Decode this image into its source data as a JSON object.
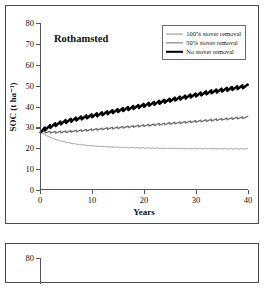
{
  "figure": {
    "panels": [
      {
        "name": "Rothamsted panel"
      },
      {
        "name": "second panel (cropped)"
      }
    ]
  },
  "panel1": {
    "title": "Rothamsted",
    "xlabel": "Years",
    "ylabel": "SOC (t ha⁻¹)",
    "yticks": [
      "80",
      "70",
      "60",
      "50",
      "40",
      "30",
      "20",
      "10",
      "0"
    ],
    "xticks": [
      "0",
      "10",
      "20",
      "30",
      "40"
    ],
    "legend": [
      {
        "label": "100% stover removal",
        "style": "thin-gray"
      },
      {
        "label": "50% stover removal",
        "style": "medium-gray"
      },
      {
        "label": "No stover removal",
        "style": "thick-black"
      }
    ]
  },
  "panel2": {
    "yticks": [
      "80"
    ]
  },
  "colors": {
    "no_removal": "#000000",
    "half_removal": "#6e6e6e",
    "full_removal": "#8d8d8d",
    "axis": "#555555",
    "frame": "#4a4a4a",
    "background": "#ffffff"
  },
  "chart_data": {
    "type": "line",
    "title": "Rothamsted",
    "xlabel": "Years",
    "ylabel": "SOC (t ha-1)",
    "xlim": [
      0,
      40
    ],
    "ylim": [
      0,
      80
    ],
    "xticks": [
      0,
      10,
      20,
      30,
      40
    ],
    "yticks": [
      0,
      10,
      20,
      30,
      40,
      50,
      60,
      70,
      80
    ],
    "grid": false,
    "legend_position": "top-right",
    "note": "Annual sawtooth oscillation of about 1.5 t/ha amplitude superimposed on each trend; all series start at 28 t/ha at year 0.",
    "x": [
      0,
      1,
      2,
      3,
      4,
      5,
      6,
      7,
      8,
      9,
      10,
      11,
      12,
      13,
      14,
      15,
      16,
      17,
      18,
      19,
      20,
      21,
      22,
      23,
      24,
      25,
      26,
      27,
      28,
      29,
      30,
      31,
      32,
      33,
      34,
      35,
      36,
      37,
      38,
      39,
      40
    ],
    "series": [
      {
        "name": "No stover removal",
        "color": "#000000",
        "linewidth": 2.4,
        "oscillation_amplitude": 1.6,
        "values": [
          28.0,
          29.4,
          30.5,
          31.4,
          32.2,
          32.9,
          33.5,
          34.1,
          34.6,
          35.1,
          35.6,
          36.1,
          36.6,
          37.1,
          37.6,
          38.1,
          38.6,
          39.1,
          39.6,
          40.1,
          40.6,
          41.1,
          41.6,
          42.1,
          42.6,
          43.1,
          43.6,
          44.1,
          44.6,
          45.1,
          45.6,
          46.1,
          46.6,
          47.1,
          47.5,
          47.9,
          48.3,
          48.7,
          49.1,
          49.5,
          49.9
        ]
      },
      {
        "name": "50% stover removal",
        "color": "#6e6e6e",
        "linewidth": 1.3,
        "oscillation_amplitude": 0.9,
        "values": [
          28.0,
          27.8,
          27.7,
          27.7,
          27.8,
          27.9,
          28.1,
          28.3,
          28.5,
          28.7,
          28.9,
          29.1,
          29.3,
          29.5,
          29.7,
          29.9,
          30.1,
          30.3,
          30.5,
          30.7,
          30.9,
          31.1,
          31.3,
          31.5,
          31.7,
          31.9,
          32.1,
          32.3,
          32.5,
          32.7,
          32.9,
          33.1,
          33.3,
          33.5,
          33.7,
          33.9,
          34.1,
          34.3,
          34.5,
          34.7,
          34.9
        ]
      },
      {
        "name": "100% stover removal",
        "color": "#8d8d8d",
        "linewidth": 0.9,
        "oscillation_amplitude": 0.35,
        "values": [
          28.0,
          26.4,
          25.2,
          24.3,
          23.5,
          22.9,
          22.4,
          22.0,
          21.7,
          21.4,
          21.2,
          21.0,
          20.85,
          20.7,
          20.6,
          20.5,
          20.4,
          20.3,
          20.25,
          20.2,
          20.15,
          20.1,
          20.05,
          20.0,
          19.98,
          19.95,
          19.93,
          19.9,
          19.88,
          19.86,
          19.84,
          19.82,
          19.8,
          19.79,
          19.78,
          19.77,
          19.76,
          19.75,
          19.74,
          19.73,
          19.72
        ]
      }
    ]
  }
}
